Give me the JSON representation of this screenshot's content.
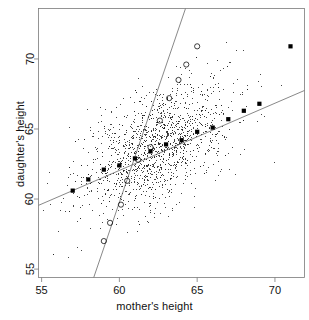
{
  "chart_data": {
    "type": "scatter",
    "title": "",
    "xlabel": "mother's height",
    "ylabel": "daughter's height",
    "xlim": [
      54.8,
      71.9
    ],
    "ylim": [
      54.4,
      73.6
    ],
    "xticks": [
      55,
      60,
      65,
      70
    ],
    "yticks": [
      55,
      60,
      65,
      70
    ],
    "xticklabels": [
      "55",
      "60",
      "65",
      "70"
    ],
    "yticklabels": [
      "55",
      "60",
      "65",
      "70"
    ],
    "grid": false,
    "legend": null,
    "box": true,
    "series": [
      {
        "name": "observations",
        "marker": "point",
        "color": "#1a1a1a",
        "size": 1,
        "n": 1375,
        "x_mean": 62.5,
        "y_mean": 63.8,
        "x_sd": 2.35,
        "y_sd": 2.3,
        "correlation": 0.49
      },
      {
        "name": "daughter-on-mother regression (filled squares)",
        "marker": "filled-square",
        "color": "#000000",
        "slope": 0.48,
        "intercept": 33.8,
        "x": [
          57,
          58,
          59,
          60,
          61,
          62,
          63,
          64,
          65,
          66,
          67,
          68,
          69,
          71
        ],
        "y": [
          60.6,
          61.4,
          62.1,
          62.4,
          62.9,
          63.4,
          63.9,
          64.2,
          64.8,
          65.1,
          65.7,
          66.3,
          66.8,
          70.9
        ]
      },
      {
        "name": "mother-on-daughter regression (open circles)",
        "marker": "open-circle",
        "color": "#000000",
        "slope": 3.25,
        "intercept": -142.0,
        "x": [
          59.0,
          59.4,
          60.1,
          60.5,
          61.2,
          62.0,
          62.6,
          63.2,
          63.8,
          64.3,
          65.0
        ],
        "y": [
          57.0,
          58.3,
          59.6,
          61.3,
          62.8,
          63.7,
          65.6,
          67.2,
          68.5,
          69.6,
          70.9
        ]
      }
    ],
    "lines": [
      {
        "name": "shallow-regression-line",
        "from": [
          54.8,
          59.55
        ],
        "to": [
          71.9,
          67.75
        ],
        "color": "#555555",
        "width": 0.7
      },
      {
        "name": "steep-regression-line",
        "from": [
          58.35,
          54.4
        ],
        "to": [
          64.25,
          73.6
        ],
        "color": "#555555",
        "width": 0.7
      }
    ]
  },
  "axes": {
    "x_title": "mother's height",
    "y_title": "daughter's height"
  }
}
